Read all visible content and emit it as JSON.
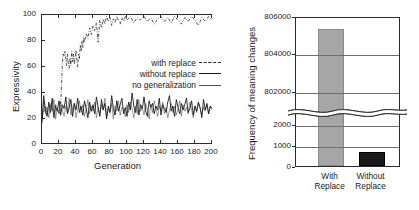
{
  "figure": {
    "panels": [
      "expressivity-over-generations",
      "frequency-of-meaning-changes"
    ]
  },
  "chart_data": [
    {
      "id": "left",
      "type": "line",
      "title": "",
      "xlabel": "Generation",
      "ylabel": "Expressivity",
      "xlim": [
        0,
        200
      ],
      "ylim": [
        0,
        100
      ],
      "xticks": [
        0,
        20,
        40,
        60,
        80,
        100,
        120,
        140,
        160,
        180,
        200
      ],
      "yticks": [
        0,
        20,
        40,
        60,
        80,
        100
      ],
      "grid": false,
      "legend_position": "center-right",
      "legend": [
        {
          "label": "with replace",
          "style": "dash-dot"
        },
        {
          "label": "without replace",
          "style": "solid"
        },
        {
          "label": "no generalization",
          "style": "thin-solid"
        }
      ],
      "series": [
        {
          "name": "with replace",
          "style": "dash-dot",
          "x": [
            0,
            2,
            4,
            6,
            8,
            10,
            12,
            14,
            16,
            18,
            20,
            21,
            22,
            23,
            24,
            25,
            26,
            27,
            28,
            29,
            30,
            31,
            32,
            33,
            34,
            35,
            36,
            37,
            38,
            39,
            40,
            41,
            42,
            43,
            44,
            45,
            46,
            47,
            48,
            49,
            50,
            52,
            54,
            56,
            58,
            60,
            62,
            64,
            66,
            68,
            70,
            72,
            74,
            76,
            78,
            80,
            82,
            84,
            86,
            88,
            90,
            92,
            94,
            96,
            98,
            100,
            104,
            108,
            112,
            116,
            120,
            124,
            128,
            132,
            136,
            140,
            144,
            148,
            152,
            156,
            160,
            164,
            168,
            172,
            176,
            180,
            184,
            188,
            192,
            196,
            200
          ],
          "values": [
            20,
            26,
            30,
            24,
            28,
            32,
            27,
            25,
            31,
            29,
            24,
            27,
            33,
            46,
            63,
            70,
            68,
            72,
            66,
            61,
            70,
            63,
            59,
            67,
            61,
            72,
            64,
            70,
            62,
            67,
            73,
            65,
            60,
            70,
            66,
            77,
            72,
            80,
            75,
            83,
            79,
            86,
            82,
            90,
            85,
            92,
            88,
            94,
            79,
            96,
            90,
            97,
            93,
            99,
            95,
            98,
            92,
            97,
            94,
            99,
            96,
            93,
            98,
            95,
            99,
            96,
            99,
            94,
            98,
            96,
            99,
            95,
            98,
            93,
            97,
            99,
            95,
            98,
            94,
            99,
            96,
            93,
            98,
            95,
            99,
            96,
            92,
            98,
            95,
            99,
            96
          ]
        },
        {
          "name": "without replace",
          "style": "solid",
          "x": [
            0,
            2,
            4,
            6,
            8,
            10,
            12,
            14,
            16,
            18,
            20,
            22,
            24,
            26,
            28,
            30,
            32,
            34,
            36,
            38,
            40,
            42,
            44,
            46,
            48,
            50,
            52,
            54,
            56,
            58,
            60,
            62,
            64,
            66,
            68,
            70,
            72,
            74,
            76,
            78,
            80,
            82,
            84,
            86,
            88,
            90,
            92,
            94,
            96,
            98,
            100,
            102,
            104,
            106,
            108,
            110,
            112,
            114,
            116,
            118,
            120,
            122,
            124,
            126,
            128,
            130,
            132,
            134,
            136,
            138,
            140,
            142,
            144,
            146,
            148,
            150,
            152,
            154,
            156,
            158,
            160,
            162,
            164,
            166,
            168,
            170,
            172,
            174,
            176,
            178,
            180,
            182,
            184,
            186,
            188,
            190,
            192,
            194,
            196,
            198,
            200
          ],
          "values": [
            18,
            38,
            27,
            22,
            33,
            25,
            36,
            21,
            30,
            26,
            34,
            23,
            31,
            28,
            37,
            24,
            29,
            35,
            22,
            32,
            27,
            36,
            25,
            30,
            23,
            34,
            28,
            21,
            33,
            26,
            31,
            24,
            37,
            29,
            22,
            35,
            27,
            32,
            20,
            30,
            25,
            38,
            28,
            23,
            34,
            26,
            31,
            36,
            24,
            29,
            22,
            33,
            27,
            40,
            30,
            25,
            35,
            23,
            31,
            28,
            37,
            26,
            22,
            34,
            29,
            32,
            24,
            30,
            27,
            36,
            23,
            31,
            28,
            25,
            33,
            38,
            26,
            30,
            22,
            35,
            29,
            24,
            32,
            27,
            31,
            36,
            25,
            28,
            34,
            23,
            30,
            26,
            33,
            29,
            21,
            35,
            27,
            32,
            24,
            30,
            28
          ]
        },
        {
          "name": "no generalization",
          "style": "thin-solid",
          "x": [
            0,
            2,
            4,
            6,
            8,
            10,
            12,
            14,
            16,
            18,
            20,
            22,
            24,
            26,
            28,
            30,
            32,
            34,
            36,
            38,
            40,
            42,
            44,
            46,
            48,
            50,
            52,
            54,
            56,
            58,
            60,
            62,
            64,
            66,
            68,
            70,
            72,
            74,
            76,
            78,
            80,
            82,
            84,
            86,
            88,
            90,
            92,
            94,
            96,
            98,
            100,
            102,
            104,
            106,
            108,
            110,
            112,
            114,
            116,
            118,
            120,
            122,
            124,
            126,
            128,
            130,
            132,
            134,
            136,
            138,
            140,
            142,
            144,
            146,
            148,
            150,
            152,
            154,
            156,
            158,
            160,
            162,
            164,
            166,
            168,
            170,
            172,
            174,
            176,
            178,
            180,
            182,
            184,
            186,
            188,
            190,
            192,
            194,
            196,
            198,
            200
          ],
          "values": [
            16,
            34,
            24,
            29,
            21,
            31,
            26,
            35,
            20,
            28,
            24,
            33,
            27,
            22,
            30,
            25,
            36,
            23,
            29,
            32,
            21,
            27,
            34,
            25,
            31,
            22,
            28,
            35,
            24,
            30,
            26,
            33,
            21,
            29,
            23,
            31,
            27,
            36,
            22,
            28,
            25,
            32,
            20,
            30,
            26,
            34,
            23,
            29,
            27,
            22,
            31,
            25,
            33,
            28,
            21,
            30,
            24,
            35,
            26,
            29,
            23,
            32,
            27,
            20,
            31,
            25,
            34,
            28,
            22,
            30,
            26,
            33,
            24,
            29,
            21,
            27,
            32,
            25,
            30,
            23,
            28,
            34,
            22,
            31,
            26,
            29,
            24,
            33,
            27,
            21,
            30,
            25,
            32,
            28,
            23,
            29,
            26,
            31,
            24,
            30,
            27
          ]
        }
      ]
    },
    {
      "id": "right",
      "type": "bar",
      "title": "",
      "xlabel": "",
      "ylabel": "Frequency of meaning changes",
      "broken_axis": true,
      "categories": [
        "With Replace",
        "Without Replace"
      ],
      "category_lines": [
        [
          "With",
          "Replace"
        ],
        [
          "Without",
          "Replace"
        ]
      ],
      "values": [
        805300,
        650
      ],
      "yticks_upper": [
        802000,
        804000,
        806000
      ],
      "yticks_lower": [
        0,
        1000,
        2000
      ],
      "ylim_upper": [
        801300,
        806000
      ],
      "ylim_lower": [
        0,
        2400
      ],
      "grid": true,
      "colors": {
        "with_replace": "#a6a6a6",
        "without_replace": "#1a1a1a"
      }
    }
  ]
}
